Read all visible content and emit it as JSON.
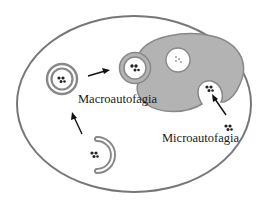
{
  "diagram": {
    "labels": {
      "macro": "Macroautofagia",
      "micro": "Microautofagia"
    },
    "colors": {
      "membrane": "#7a7a7a",
      "lysosome_fill": "#b3b3b3",
      "cargo": "#222222",
      "cell_border": "#777777",
      "arrow": "#111111"
    },
    "elements": [
      "cell-membrane",
      "phagophore",
      "autophagosome",
      "autolysosome",
      "lysosome",
      "microautophagy-invagination",
      "cytoplasmic-cargo"
    ]
  }
}
